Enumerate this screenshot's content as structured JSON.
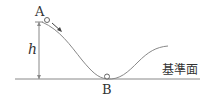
{
  "diagram": {
    "labels": {
      "point_a": "A",
      "point_b": "B",
      "height": "h",
      "reference_plane": "基準面"
    },
    "colors": {
      "stroke": "#888888",
      "text": "#333333"
    }
  }
}
